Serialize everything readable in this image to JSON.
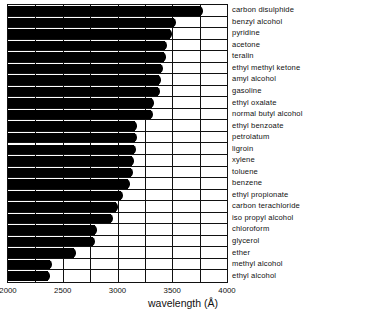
{
  "chart_data": {
    "type": "bar",
    "orientation": "horizontal",
    "title": "",
    "xlabel": "wavelength (Å)",
    "ylabel": "",
    "xlim": [
      2000,
      4000
    ],
    "xticks": [
      2000,
      2500,
      3000,
      3500,
      4000
    ],
    "xtick_labels": [
      "2000",
      "2500",
      "3000",
      "3500",
      "4000"
    ],
    "minor_gridline_step": 250,
    "grid": true,
    "legend": null,
    "value_meaning": "Right edge of each black bar is the ultraviolet transmission cutoff wavelength; black = opaque region, white = transparent region.",
    "categories": [
      "carbon disulphide",
      "benzyl alcohol",
      "pyridine",
      "acetone",
      "teralin",
      "ethyl methyl ketone",
      "amyl alcohol",
      "gasoline",
      "ethyl oxalate",
      "normal butyl alcohol",
      "ethyl benzoate",
      "petrolatum",
      "ligroin",
      "xylene",
      "toluene",
      "benzene",
      "ethyl propionate",
      "carbon terachloride",
      "iso propyl alcohol",
      "chloroform",
      "glycerol",
      "ether",
      "methyl alcohol",
      "ethyl alcohol"
    ],
    "values": [
      3780,
      3530,
      3500,
      3450,
      3440,
      3420,
      3400,
      3390,
      3330,
      3320,
      3180,
      3180,
      3170,
      3150,
      3140,
      3110,
      3050,
      3000,
      2960,
      2810,
      2790,
      2620,
      2400,
      2380
    ]
  },
  "axis": {
    "x_title": "wavelength (Å)"
  },
  "colors": {
    "bar": "#000000",
    "background": "#ffffff",
    "grid": "#111111",
    "text": "#111111"
  }
}
